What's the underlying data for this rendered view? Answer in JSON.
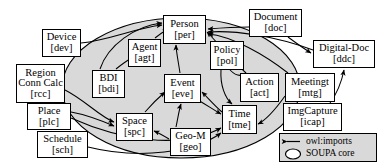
{
  "diagram": {
    "core_region_label": "SOUPA core",
    "core_fill": "#d9d9d9",
    "edge_color": "#000000",
    "nodes": [
      {
        "id": "dev",
        "title": "Device",
        "code": "[dev]",
        "x": 42,
        "y": 29,
        "w": 39,
        "h": 28,
        "inside_core": false
      },
      {
        "id": "rcc",
        "title": "Region",
        "title2": "Conn Calc",
        "code": "[rcc]",
        "x": 16,
        "y": 64,
        "w": 49,
        "h": 39,
        "inside_core": false
      },
      {
        "id": "plc",
        "title": "Place",
        "code": "[plc]",
        "x": 27,
        "y": 103,
        "w": 44,
        "h": 27,
        "inside_core": false
      },
      {
        "id": "sch",
        "title": "Schedule",
        "code": "[sch]",
        "x": 37,
        "y": 131,
        "w": 51,
        "h": 27,
        "inside_core": false
      },
      {
        "id": "per",
        "title": "Person",
        "code": "[per]",
        "x": 163,
        "y": 15,
        "w": 43,
        "h": 29,
        "inside_core": true
      },
      {
        "id": "agt",
        "title": "Agent",
        "code": "[agt]",
        "x": 128,
        "y": 39,
        "w": 33,
        "h": 28,
        "inside_core": true
      },
      {
        "id": "bdi",
        "title": "BDI",
        "code": "[bdi]",
        "x": 92,
        "y": 70,
        "w": 33,
        "h": 28,
        "inside_core": true
      },
      {
        "id": "eve",
        "title": "Event",
        "code": "[eve]",
        "x": 164,
        "y": 74,
        "w": 37,
        "h": 29,
        "inside_core": true
      },
      {
        "id": "pol",
        "title": "Policy",
        "code": "[pol]",
        "x": 210,
        "y": 41,
        "w": 34,
        "h": 29,
        "inside_core": true
      },
      {
        "id": "act",
        "title": "Action",
        "code": "[act]",
        "x": 240,
        "y": 73,
        "w": 39,
        "h": 29,
        "inside_core": true
      },
      {
        "id": "spc",
        "title": "Space",
        "code": "[spc]",
        "x": 116,
        "y": 113,
        "w": 37,
        "h": 28,
        "inside_core": true
      },
      {
        "id": "geo",
        "title": "Geo-M",
        "code": "[geo]",
        "x": 170,
        "y": 128,
        "w": 41,
        "h": 28,
        "inside_core": true
      },
      {
        "id": "tme",
        "title": "Time",
        "code": "[tme]",
        "x": 222,
        "y": 105,
        "w": 35,
        "h": 29,
        "inside_core": true
      },
      {
        "id": "doc",
        "title": "Document",
        "code": "[doc]",
        "x": 249,
        "y": 9,
        "w": 53,
        "h": 28,
        "inside_core": false
      },
      {
        "id": "ddc",
        "title": "Digital-Doc",
        "code": "[ddc]",
        "x": 313,
        "y": 40,
        "w": 62,
        "h": 28,
        "inside_core": false
      },
      {
        "id": "mtg",
        "title": "Meetingt",
        "code": "[mtg]",
        "x": 285,
        "y": 73,
        "w": 50,
        "h": 29,
        "inside_core": false
      },
      {
        "id": "icap",
        "title": "ImgCapture",
        "code": "[icap]",
        "x": 283,
        "y": 103,
        "w": 59,
        "h": 28,
        "inside_core": false
      }
    ],
    "edges": [
      {
        "from": "dev",
        "to": "per"
      },
      {
        "from": "rcc",
        "to": "spc"
      },
      {
        "from": "plc",
        "to": "spc"
      },
      {
        "from": "sch",
        "to": "tme"
      },
      {
        "from": "agt",
        "to": "per"
      },
      {
        "from": "bdi",
        "to": "agt"
      },
      {
        "from": "bdi",
        "to": "per"
      },
      {
        "from": "eve",
        "to": "per"
      },
      {
        "from": "pol",
        "to": "act"
      },
      {
        "from": "pol",
        "to": "tme"
      },
      {
        "from": "act",
        "to": "per"
      },
      {
        "from": "spc",
        "to": "eve"
      },
      {
        "from": "geo",
        "to": "spc"
      },
      {
        "from": "tme",
        "to": "eve"
      },
      {
        "from": "doc",
        "to": "per"
      },
      {
        "from": "doc",
        "to": "ddc"
      },
      {
        "from": "ddc",
        "to": "per"
      },
      {
        "from": "mtg",
        "to": "per"
      },
      {
        "from": "mtg",
        "to": "tme"
      },
      {
        "from": "icap",
        "to": "ddc"
      }
    ],
    "legend": {
      "x": 279,
      "y": 133,
      "w": 98,
      "h": 29,
      "rows": [
        {
          "icon": "arrow-icon",
          "label": "owl:imports"
        },
        {
          "icon": "ellipse-icon",
          "label": "SOUPA core"
        }
      ]
    }
  }
}
